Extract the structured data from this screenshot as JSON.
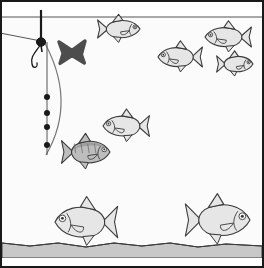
{
  "illustration": {
    "title": "Fishing float rig underwater scene",
    "frame": {
      "border_color": "#1a1a1a",
      "border_width": 2,
      "x": 1,
      "y": 1,
      "width": 262,
      "height": 266
    },
    "colors": {
      "air": "#ffffff",
      "water": "#fbfbfb",
      "sediment": "#c8c8c8",
      "line": "#555555",
      "rod": "#777777",
      "float_body": "#1a1a1a",
      "marker_x": "#4d4d4d",
      "fish_light": "#e6e6e6",
      "fish_dark": "#bdbdbd",
      "fish_outline": "#3a3a3a",
      "surface_line": "#555555",
      "sediment_line": "#3a3a3a"
    },
    "water_surface": {
      "label": "water surface line",
      "y": 17
    },
    "sediment": {
      "label": "lake bed sediment",
      "top_y": 243,
      "bottom_y": 258
    }
  },
  "rig": {
    "label": "float rig",
    "float": {
      "label": "fishing float",
      "antenna_x": 41,
      "antenna_top_y": 10,
      "body_center_x": 41,
      "body_center_y": 42
    },
    "mainline": {
      "label": "main line to rod tip",
      "from_x": 41,
      "from_y": 41,
      "to_x": 0,
      "to_y": 33
    },
    "rod_curve": {
      "label": "curved rod arc",
      "start_x": 42,
      "start_y": 38,
      "ctrl_x": 78,
      "ctrl_y": 100,
      "end_x": 46,
      "end_y": 155
    },
    "dropper_line": {
      "label": "vertical drop line below float",
      "x": 47,
      "top_y": 42,
      "bottom_y": 155
    },
    "hook": {
      "label": "baited hook",
      "x": 33,
      "y": 55
    },
    "shots": {
      "label": "split shot weights",
      "count": 4,
      "positions": [
        {
          "x": 47,
          "y": 97
        },
        {
          "x": 47,
          "y": 113
        },
        {
          "x": 47,
          "y": 127
        },
        {
          "x": 47,
          "y": 145
        }
      ],
      "radius": 3
    }
  },
  "marker": {
    "label": "X marker",
    "symbol": "✖",
    "x": 72,
    "y": 52,
    "size": 26,
    "color": "#4d4d4d"
  },
  "fish": [
    {
      "id": "fish-1",
      "label": "small roach upper left-centre",
      "facing": "left",
      "shade": "light",
      "x": 119,
      "y": 29,
      "length": 42,
      "height": 19
    },
    {
      "id": "fish-2",
      "label": "roach upper right",
      "facing": "right",
      "shade": "light",
      "x": 228,
      "y": 37,
      "length": 46,
      "height": 21
    },
    {
      "id": "fish-3",
      "label": "roach middle right",
      "facing": "right",
      "shade": "light",
      "x": 180,
      "y": 57,
      "length": 44,
      "height": 21
    },
    {
      "id": "fish-4",
      "label": "small roach far right",
      "facing": "left",
      "shade": "light",
      "x": 235,
      "y": 64,
      "length": 36,
      "height": 17
    },
    {
      "id": "fish-5",
      "label": "roach centre",
      "facing": "right",
      "shade": "light",
      "x": 126,
      "y": 126,
      "length": 46,
      "height": 22
    },
    {
      "id": "fish-6",
      "label": "dark perch left of centre",
      "facing": "left",
      "shade": "dark",
      "x": 86,
      "y": 152,
      "length": 48,
      "height": 24
    },
    {
      "id": "fish-7",
      "label": "large bream bottom left",
      "facing": "right",
      "shade": "light",
      "x": 86,
      "y": 222,
      "length": 62,
      "height": 33
    },
    {
      "id": "fish-8",
      "label": "large bream bottom right",
      "facing": "left",
      "shade": "light",
      "x": 218,
      "y": 220,
      "length": 64,
      "height": 34
    }
  ]
}
